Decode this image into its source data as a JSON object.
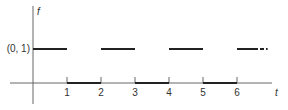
{
  "chart_data": {
    "type": "line",
    "title": "",
    "xlabel": "t",
    "ylabel": "f",
    "y_tick_label": "(0, 1)",
    "x_ticks": [
      "1",
      "2",
      "3",
      "4",
      "5",
      "6"
    ],
    "xlim": [
      0,
      7.2
    ],
    "ylim": [
      0,
      1
    ],
    "grid": false,
    "legend": null,
    "segments": [
      {
        "x": [
          0,
          1
        ],
        "y": 1,
        "style": "solid"
      },
      {
        "x": [
          1,
          2
        ],
        "y": 0,
        "style": "solid"
      },
      {
        "x": [
          2,
          3
        ],
        "y": 1,
        "style": "solid"
      },
      {
        "x": [
          3,
          4
        ],
        "y": 0,
        "style": "solid"
      },
      {
        "x": [
          4,
          5
        ],
        "y": 1,
        "style": "solid"
      },
      {
        "x": [
          5,
          6
        ],
        "y": 0,
        "style": "solid"
      },
      {
        "x": [
          6,
          6.5
        ],
        "y": 1,
        "style": "solid"
      },
      {
        "x": [
          6.5,
          6.9
        ],
        "y": 1,
        "style": "dashed"
      }
    ],
    "colors": {
      "line": "#222222",
      "axis": "#555555"
    }
  }
}
